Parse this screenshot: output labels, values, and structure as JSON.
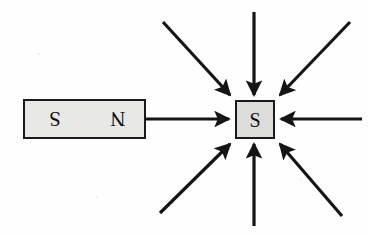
{
  "figure": {
    "type": "physics-field-diagram",
    "title": "",
    "background_color": "#fefefe",
    "ink_color": "#151515",
    "shape_fill_color": "#e3e3e1",
    "bar_magnet": {
      "label": "bar-magnet",
      "left_pole_label": "S",
      "right_pole_label": "N",
      "letters_rotated_180": true,
      "x": 24,
      "y": 100,
      "width": 121,
      "height": 38,
      "fill": "#e8e8e6",
      "stroke": "#1a1a1a"
    },
    "target_square": {
      "label": "target-pole",
      "pole_label": "S",
      "x": 236,
      "y": 101,
      "width": 38,
      "height": 37,
      "fill": "#dcdcda",
      "stroke": "#1a1a1a"
    },
    "field_arrows": [
      {
        "name": "arrow-from-magnet-west",
        "direction": "east",
        "from_x": 145,
        "from_y": 119,
        "to_x": 233,
        "to_y": 119
      },
      {
        "name": "arrow-north",
        "direction": "south",
        "from_x": 254,
        "from_y": 12,
        "to_x": 254,
        "to_y": 99
      },
      {
        "name": "arrow-northwest",
        "direction": "southeast",
        "from_x": 163,
        "from_y": 22,
        "to_x": 233,
        "to_y": 98
      },
      {
        "name": "arrow-northeast",
        "direction": "southwest",
        "from_x": 350,
        "from_y": 22,
        "to_x": 277,
        "to_y": 98
      },
      {
        "name": "arrow-east",
        "direction": "west",
        "from_x": 362,
        "from_y": 119,
        "to_x": 277,
        "to_y": 119
      },
      {
        "name": "arrow-southeast",
        "direction": "northwest",
        "from_x": 342,
        "from_y": 216,
        "to_x": 277,
        "to_y": 141
      },
      {
        "name": "arrow-south",
        "direction": "north",
        "from_x": 254,
        "from_y": 226,
        "to_x": 254,
        "to_y": 141
      },
      {
        "name": "arrow-southwest",
        "direction": "northeast",
        "from_x": 160,
        "from_y": 213,
        "to_x": 233,
        "to_y": 141
      }
    ],
    "arrow_count": 8,
    "arrow_direction_summary": "all arrows point inward toward the target square"
  }
}
